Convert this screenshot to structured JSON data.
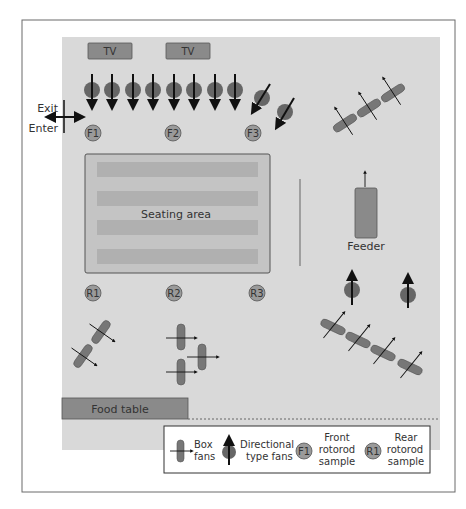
{
  "colors": {
    "frame_border": "#6a6a6a",
    "room_fill": "#d9d9d9",
    "box_fill": "#8a8a8a",
    "box_stroke": "#555555",
    "seating_fill": "#c4c4c4",
    "seating_bar": "#b0b0b0",
    "fan_fill": "#666666",
    "sampler_fill": "#9a9a9a",
    "arrow": "#111111"
  },
  "labels": {
    "tv_left": "TV",
    "tv_right": "TV",
    "exit": "Exit",
    "enter": "Enter",
    "seating_area": "Seating area",
    "feeder": "Feeder",
    "food_table": "Food table"
  },
  "samplers": {
    "front": [
      "F1",
      "F2",
      "F3"
    ],
    "rear": [
      "R1",
      "R2",
      "R3"
    ]
  },
  "legend": {
    "box_fans_line1": "Box",
    "box_fans_line2": "fans",
    "directional_line1": "Directional",
    "directional_line2": "type fans",
    "front_badge": "F1",
    "front_line1": "Front",
    "front_line2": "rotorod",
    "front_line3": "sample",
    "rear_badge": "R1",
    "rear_line1": "Rear",
    "rear_line2": "rotorod",
    "rear_line3": "sample"
  }
}
